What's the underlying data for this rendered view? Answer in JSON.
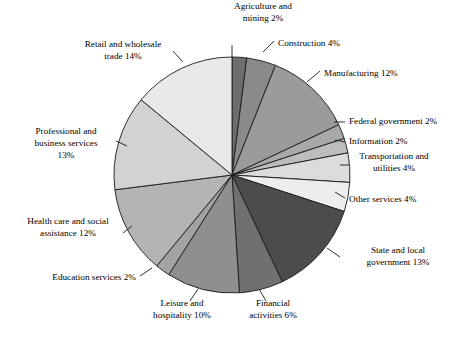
{
  "chart_data": {
    "type": "pie",
    "title": "",
    "subtitle": "",
    "xlabel": "",
    "ylabel": "",
    "legend_position": "none",
    "grid": false,
    "value_unit": "%",
    "total": 100,
    "start_angle_deg": -90,
    "direction": "clockwise",
    "categories": [
      "Agriculture and mining",
      "Construction",
      "Manufacturing",
      "Federal government",
      "Information",
      "Transportation and utilities",
      "Other services",
      "State and local government",
      "Financial activities",
      "Leisure and hospitality",
      "Education services",
      "Health care and social assistance",
      "Professional and business services",
      "Retail and wholesale trade"
    ],
    "values": [
      2,
      4,
      12,
      2,
      2,
      4,
      4,
      13,
      6,
      10,
      2,
      12,
      13,
      14
    ],
    "slices": [
      {
        "label_lines": [
          "Agriculture and",
          "mining 2%"
        ],
        "name": "Agriculture and mining",
        "value": 2,
        "value_text": "2%",
        "color": "#6d6d6d",
        "label_x": 263,
        "label_y": 13,
        "label_anchor": "middle",
        "leader": "M 232 45 L 232 57"
      },
      {
        "label_lines": [
          "Construction 4%"
        ],
        "name": "Construction",
        "value": 4,
        "value_text": "4%",
        "color": "#8a8a8a",
        "label_x": 278,
        "label_y": 44,
        "label_anchor": "start",
        "leader": "M 274 41 L 263 52"
      },
      {
        "label_lines": [
          "Manufacturing 12%"
        ],
        "name": "Manufacturing",
        "value": 12,
        "value_text": "12%",
        "color": "#9b9b9b",
        "label_x": 324,
        "label_y": 74,
        "label_anchor": "start",
        "leader": "M 320 71 L 307 82"
      },
      {
        "label_lines": [
          "Federal government 2%"
        ],
        "name": "Federal government",
        "value": 2,
        "value_text": "2%",
        "color": "#a9a9a9",
        "label_x": 349,
        "label_y": 122,
        "label_anchor": "start",
        "leader": "M 345 122 L 334 122"
      },
      {
        "label_lines": [
          "Information 2%"
        ],
        "name": "Information",
        "value": 2,
        "value_text": "2%",
        "color": "#bdbdbd",
        "label_x": 349,
        "label_y": 142,
        "label_anchor": "start",
        "leader": "M 345 142 L 335 140"
      },
      {
        "label_lines": [
          "Transportation and",
          "utilities 4%"
        ],
        "name": "Transportation and utilities",
        "value": 4,
        "value_text": "4%",
        "color": "#dcdcdc",
        "label_x": 394,
        "label_y": 163,
        "label_anchor": "middle",
        "leader": "M 349 165 L 340 165"
      },
      {
        "label_lines": [
          "Other services 4%"
        ],
        "name": "Other services",
        "value": 4,
        "value_text": "4%",
        "color": "#ededed",
        "label_x": 349,
        "label_y": 200,
        "label_anchor": "start",
        "leader": "M 345 198 L 335 192"
      },
      {
        "label_lines": [
          "State and local",
          "government 13%"
        ],
        "name": "State and local government",
        "value": 13,
        "value_text": "13%",
        "color": "#4c4c4c",
        "label_x": 398,
        "label_y": 257,
        "label_anchor": "middle",
        "leader": "M 340 257 L 327 248"
      },
      {
        "label_lines": [
          "Financial",
          "activities 6%"
        ],
        "name": "Financial activities",
        "value": 6,
        "value_text": "6%",
        "color": "#707070",
        "label_x": 273,
        "label_y": 310,
        "label_anchor": "middle",
        "leader": "M 266 301 L 259 289"
      },
      {
        "label_lines": [
          "Leisure and",
          "hospitality 10%"
        ],
        "name": "Leisure and hospitality",
        "value": 10,
        "value_text": "10%",
        "color": "#8f8f8f",
        "label_x": 182,
        "label_y": 310,
        "label_anchor": "middle",
        "leader": "M 190 301 L 198 289"
      },
      {
        "label_lines": [
          "Education services 2%"
        ],
        "name": "Education services",
        "value": 2,
        "value_text": "2%",
        "color": "#a3a3a3",
        "label_x": 136,
        "label_y": 278,
        "label_anchor": "end",
        "leader": "M 140 276 L 152 268"
      },
      {
        "label_lines": [
          "Health care and social",
          "assistance 12%"
        ],
        "name": "Health care and social assistance",
        "value": 12,
        "value_text": "12%",
        "color": "#b4b4b4",
        "label_x": 68,
        "label_y": 228,
        "label_anchor": "middle",
        "leader": "M 123 233 L 132 226"
      },
      {
        "label_lines": [
          "Professional and",
          "business services",
          "13%"
        ],
        "name": "Professional and business services",
        "value": 13,
        "value_text": "13%",
        "color": "#d2d2d2",
        "label_x": 66,
        "label_y": 144,
        "label_anchor": "middle",
        "leader": "M 116 141 L 127 146"
      },
      {
        "label_lines": [
          "Retail and wholesale",
          "trade 14%"
        ],
        "name": "Retail and wholesale trade",
        "value": 14,
        "value_text": "14%",
        "color": "#e9e9e9",
        "label_x": 123,
        "label_y": 51,
        "label_anchor": "middle",
        "leader": "M 173 51 L 183 62"
      }
    ],
    "geometry": {
      "center_x": 232,
      "center_y": 175,
      "radius": 118
    }
  }
}
